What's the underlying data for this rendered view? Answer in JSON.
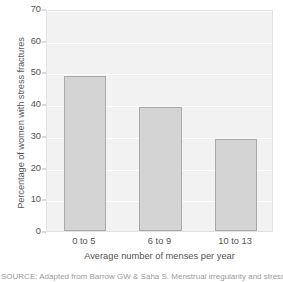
{
  "chart_data": {
    "type": "bar",
    "title": "",
    "subtitle": "",
    "categories": [
      "0 to 5",
      "6 to 9",
      "10 to 13"
    ],
    "values": [
      49,
      39,
      29
    ],
    "xlabel": "Average number of menses per year",
    "ylabel": "Percentage of women with stress fractures",
    "ylim": [
      0,
      70
    ],
    "yticks": [
      0,
      10,
      20,
      30,
      40,
      50,
      60,
      70
    ],
    "ytick_labels": [
      "0",
      "10",
      "20",
      "30",
      "40",
      "50",
      "60",
      "70"
    ],
    "grid": "horizontal",
    "legend": "none",
    "annotations": [],
    "series": [
      {
        "name": "Percentage of women with stress fractures",
        "values": [
          49,
          39,
          29
        ]
      }
    ]
  },
  "style": {
    "plot_background": "#f2f2f2",
    "gridline_color": "#ffffff",
    "bar_fill": "#d4d4d4",
    "bar_border": "#a9a9a9",
    "frame_color": "#e2e2e2",
    "text_color": "#555555"
  },
  "caption": {
    "source_text": "SOURCE: Adapted from Barrow GW & Saha S. Menstrual irregularity and stress fractures"
  }
}
